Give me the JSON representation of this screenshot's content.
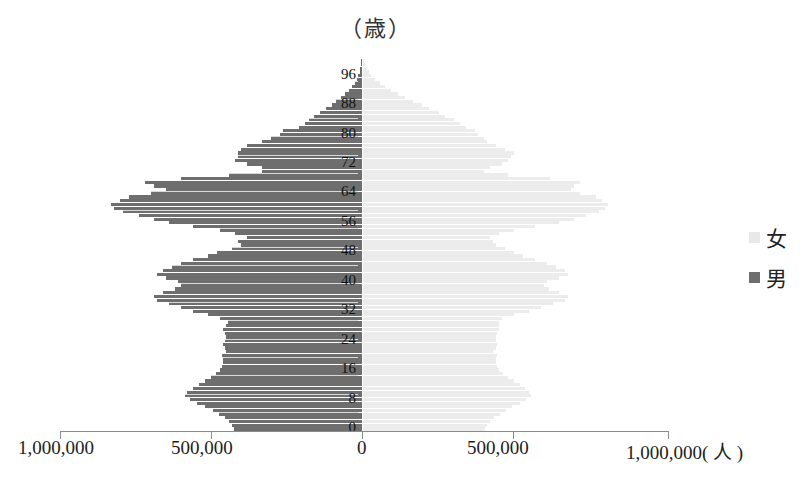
{
  "chart_data": {
    "type": "bar",
    "subtype": "population-pyramid",
    "title": "",
    "ylabel": "（歳）",
    "xlabel": "(人)",
    "orientation": "horizontal",
    "xlim": [
      -1000000,
      1000000
    ],
    "x_tick_labels": [
      "1,000,000",
      "500,000",
      "0",
      "500,000",
      "1,000,000( 人 )"
    ],
    "y_tick_labels": [
      "0",
      "8",
      "16",
      "24",
      "32",
      "40",
      "48",
      "56",
      "64",
      "72",
      "80",
      "88",
      "96"
    ],
    "grid": false,
    "legend": {
      "position": "right",
      "entries": [
        "女",
        "男"
      ]
    },
    "colors": {
      "male": "#6e6e6e",
      "female": "#ececec"
    },
    "ages": [
      0,
      1,
      2,
      3,
      4,
      5,
      6,
      7,
      8,
      9,
      10,
      11,
      12,
      13,
      14,
      15,
      16,
      17,
      18,
      19,
      20,
      21,
      22,
      23,
      24,
      25,
      26,
      27,
      28,
      29,
      30,
      31,
      32,
      33,
      34,
      35,
      36,
      37,
      38,
      39,
      40,
      41,
      42,
      43,
      44,
      45,
      46,
      47,
      48,
      49,
      50,
      51,
      52,
      53,
      54,
      55,
      56,
      57,
      58,
      59,
      60,
      61,
      62,
      63,
      64,
      65,
      66,
      67,
      68,
      69,
      70,
      71,
      72,
      73,
      74,
      75,
      76,
      77,
      78,
      79,
      80,
      81,
      82,
      83,
      84,
      85,
      86,
      87,
      88,
      89,
      90,
      91,
      92,
      93,
      94,
      95,
      96,
      97,
      98,
      99,
      100
    ],
    "series": [
      {
        "name": "男",
        "values": [
          425000,
          430000,
          440000,
          455000,
          475000,
          495000,
          520000,
          545000,
          570000,
          585000,
          580000,
          560000,
          540000,
          520000,
          500000,
          485000,
          470000,
          465000,
          460000,
          460000,
          465000,
          450000,
          455000,
          460000,
          455000,
          450000,
          455000,
          460000,
          450000,
          445000,
          470000,
          510000,
          560000,
          600000,
          640000,
          680000,
          690000,
          660000,
          620000,
          600000,
          610000,
          650000,
          680000,
          660000,
          630000,
          600000,
          560000,
          510000,
          480000,
          430000,
          400000,
          410000,
          380000,
          420000,
          470000,
          560000,
          640000,
          690000,
          740000,
          790000,
          820000,
          830000,
          800000,
          770000,
          700000,
          650000,
          690000,
          720000,
          600000,
          440000,
          330000,
          330000,
          380000,
          420000,
          410000,
          410000,
          400000,
          380000,
          330000,
          300000,
          270000,
          260000,
          210000,
          190000,
          175000,
          160000,
          140000,
          120000,
          100000,
          85000,
          70000,
          55000,
          42000,
          32000,
          24000,
          17000,
          12000,
          8000,
          5000,
          3000,
          2000
        ]
      },
      {
        "name": "女",
        "values": [
          405000,
          410000,
          420000,
          435000,
          455000,
          475000,
          495000,
          520000,
          540000,
          555000,
          550000,
          535000,
          520000,
          500000,
          480000,
          465000,
          450000,
          445000,
          440000,
          440000,
          445000,
          430000,
          440000,
          445000,
          440000,
          440000,
          445000,
          450000,
          450000,
          450000,
          460000,
          500000,
          550000,
          590000,
          630000,
          670000,
          680000,
          650000,
          615000,
          600000,
          610000,
          650000,
          680000,
          670000,
          640000,
          610000,
          570000,
          530000,
          500000,
          470000,
          440000,
          430000,
          420000,
          450000,
          500000,
          570000,
          650000,
          700000,
          740000,
          780000,
          800000,
          810000,
          790000,
          770000,
          720000,
          690000,
          700000,
          720000,
          620000,
          480000,
          400000,
          420000,
          460000,
          480000,
          490000,
          500000,
          470000,
          440000,
          410000,
          400000,
          380000,
          370000,
          340000,
          320000,
          300000,
          270000,
          250000,
          220000,
          195000,
          165000,
          140000,
          115000,
          92000,
          72000,
          55000,
          40000,
          28000,
          19000,
          12000,
          7000,
          4000
        ]
      }
    ]
  },
  "labels": {
    "y_unit": "（歳）",
    "legend_female": "女",
    "legend_male": "男"
  }
}
